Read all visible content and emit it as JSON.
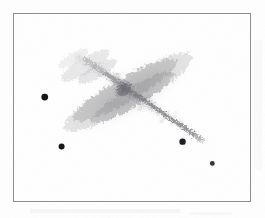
{
  "figure": {
    "title": "",
    "caption": "",
    "background_color": "#fefefe",
    "frame": {
      "x": 13,
      "y": 13,
      "width": 238,
      "height": 189,
      "border_color": "#8d8d90",
      "border_width": 1,
      "fill_color": "#ffffff"
    }
  },
  "image_data": {
    "type": "astronomical-grayscale-negative",
    "polarity": "inverted",
    "description": "Edge-on irregular galaxy with mottled knotty disk and four foreground point sources",
    "sky_background_level": "#ffffff",
    "max_density_color": "#5c5c60",
    "objects": [
      {
        "name": "galaxy",
        "kind": "extended-source",
        "morphology": "edge-on irregular / late-type disk",
        "center_x": 130,
        "center_y": 93,
        "major_axis": 148,
        "minor_axis": 30,
        "position_angle_deg": -30,
        "peak_darkness": 0.62,
        "core_x": 124,
        "core_y": 89
      },
      {
        "name": "star-1",
        "kind": "point-source",
        "x": 45,
        "y": 98,
        "radius": 3.4,
        "darkness": 0.85,
        "halo_radius": 5.5
      },
      {
        "name": "star-2",
        "kind": "point-source",
        "x": 62,
        "y": 148,
        "radius": 3.0,
        "darkness": 0.82,
        "halo_radius": 5.0
      },
      {
        "name": "star-3",
        "kind": "point-source",
        "x": 184,
        "y": 143,
        "radius": 3.2,
        "darkness": 0.78,
        "halo_radius": 6.5
      },
      {
        "name": "star-4",
        "kind": "point-source",
        "x": 214,
        "y": 165,
        "radius": 2.4,
        "darkness": 0.62,
        "halo_radius": 4.5
      }
    ],
    "disk_knots": [
      {
        "x": 78,
        "y": 57,
        "r": 7,
        "d": 0.1
      },
      {
        "x": 86,
        "y": 62,
        "r": 8,
        "d": 0.13
      },
      {
        "x": 94,
        "y": 66,
        "r": 8,
        "d": 0.16
      },
      {
        "x": 101,
        "y": 71,
        "r": 9,
        "d": 0.19
      },
      {
        "x": 108,
        "y": 75,
        "r": 9,
        "d": 0.24
      },
      {
        "x": 114,
        "y": 79,
        "r": 10,
        "d": 0.3
      },
      {
        "x": 120,
        "y": 84,
        "r": 11,
        "d": 0.4
      },
      {
        "x": 125,
        "y": 89,
        "r": 12,
        "d": 0.52
      },
      {
        "x": 131,
        "y": 93,
        "r": 11,
        "d": 0.44
      },
      {
        "x": 137,
        "y": 97,
        "r": 10,
        "d": 0.36
      },
      {
        "x": 144,
        "y": 101,
        "r": 10,
        "d": 0.34
      },
      {
        "x": 151,
        "y": 105,
        "r": 10,
        "d": 0.38
      },
      {
        "x": 158,
        "y": 110,
        "r": 9,
        "d": 0.33
      },
      {
        "x": 165,
        "y": 114,
        "r": 9,
        "d": 0.3
      },
      {
        "x": 172,
        "y": 119,
        "r": 8,
        "d": 0.28
      },
      {
        "x": 179,
        "y": 123,
        "r": 8,
        "d": 0.26
      },
      {
        "x": 186,
        "y": 127,
        "r": 7,
        "d": 0.23
      },
      {
        "x": 193,
        "y": 132,
        "r": 6,
        "d": 0.18
      },
      {
        "x": 199,
        "y": 136,
        "r": 5,
        "d": 0.12
      },
      {
        "x": 204,
        "y": 139,
        "r": 4,
        "d": 0.08
      }
    ],
    "dust_lane": {
      "start_x": 96,
      "start_y": 64,
      "end_x": 201,
      "end_y": 137,
      "width": 4,
      "darkness": 0.3
    },
    "halo": {
      "cx": 130,
      "cy": 93,
      "rx": 80,
      "ry": 26,
      "rotation_deg": -30,
      "darkness": 0.09
    }
  },
  "annotations": {
    "axis_labels": [],
    "tick_labels": [],
    "legend": [],
    "scale_bar": "",
    "compass": ""
  }
}
